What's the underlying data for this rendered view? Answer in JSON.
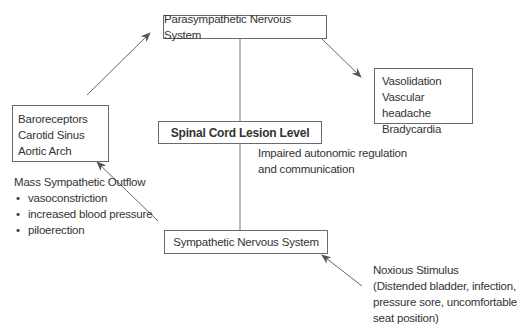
{
  "diagram": {
    "nodes": {
      "parasympathetic": {
        "label": "Parasympathetic Nervous System"
      },
      "spinal_cord": {
        "label": "Spinal Cord Lesion Level"
      },
      "sympathetic": {
        "label": "Sympathetic Nervous System"
      },
      "parasympathetic_effects": {
        "lines": [
          "Vasolidation",
          "Vascular headache",
          "Bradycardia"
        ]
      },
      "baroreceptors": {
        "lines": [
          "Baroreceptors",
          "Carotid Sinus",
          "Aortic Arch"
        ]
      }
    },
    "annotations": {
      "impaired": {
        "lines": [
          "Impaired autonomic regulation",
          "and communication"
        ]
      },
      "mass_outflow": {
        "title": "Mass Sympathetic Outflow",
        "bullets": [
          "vasoconstriction",
          "increased blood pressure",
          "piloerection"
        ]
      },
      "noxious": {
        "lines": [
          "Noxious Stimulus",
          "(Distended bladder, infection,",
          "pressure sore, uncomfortable",
          "seat position)"
        ]
      }
    },
    "edges": [
      {
        "from": "baroreceptors",
        "to": "parasympathetic",
        "type": "arrow"
      },
      {
        "from": "parasympathetic",
        "to": "parasympathetic_effects",
        "type": "arrow"
      },
      {
        "from": "parasympathetic",
        "to": "sympathetic",
        "type": "line",
        "via": "spinal_cord"
      },
      {
        "from": "sympathetic",
        "to": "baroreceptors",
        "type": "arrow"
      },
      {
        "from": "noxious",
        "to": "sympathetic",
        "type": "arrow"
      }
    ],
    "colors": {
      "line": "#6a6a6a",
      "text": "#333333"
    }
  }
}
